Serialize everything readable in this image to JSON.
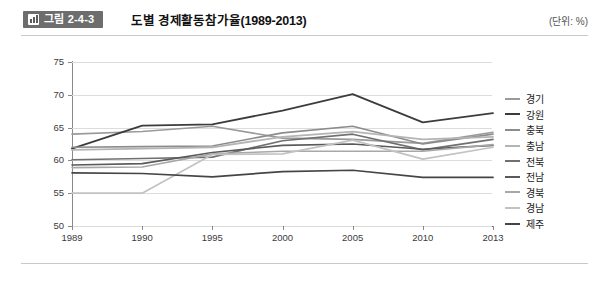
{
  "header": {
    "badge_label": "그림 2-4-3",
    "badge_icon": "bar-chart-icon",
    "title": "도별 경제활동참가율(1989-2013)",
    "unit_note": "(단위: %)",
    "badge_bg": "#6d6d6d"
  },
  "chart_data": {
    "type": "line",
    "title": "도별 경제활동참가율(1989-2013)",
    "xlabel": "",
    "ylabel": "",
    "unit": "%",
    "ylim": [
      50,
      75
    ],
    "yticks": [
      50,
      55,
      60,
      65,
      70,
      75
    ],
    "grid": true,
    "legend_position": "right",
    "categories": [
      "1989",
      "1990",
      "1995",
      "2000",
      "2005",
      "2010",
      "2013"
    ],
    "series": [
      {
        "name": "경기",
        "color": "#9a9a9a",
        "width": 1.6,
        "values": [
          64.0,
          64.4,
          65.2,
          63.4,
          63.2,
          62.6,
          64.3
        ]
      },
      {
        "name": "강원",
        "color": "#3c3c3c",
        "width": 1.8,
        "values": [
          61.8,
          65.3,
          65.5,
          67.6,
          70.1,
          65.8,
          67.2
        ]
      },
      {
        "name": "충북",
        "color": "#8c8c8c",
        "width": 1.6,
        "values": [
          62.0,
          62.1,
          62.2,
          64.2,
          65.2,
          62.5,
          64.0
        ]
      },
      {
        "name": "충남",
        "color": "#b4b4b4",
        "width": 1.8,
        "values": [
          61.6,
          61.8,
          62.0,
          63.6,
          64.4,
          63.2,
          63.6
        ]
      },
      {
        "name": "전북",
        "color": "#707070",
        "width": 1.6,
        "values": [
          60.1,
          60.3,
          60.5,
          63.0,
          64.0,
          61.6,
          63.2
        ]
      },
      {
        "name": "전남",
        "color": "#5a5a5a",
        "width": 1.7,
        "values": [
          59.3,
          59.5,
          61.2,
          62.3,
          62.5,
          61.7,
          62.3
        ]
      },
      {
        "name": "경북",
        "color": "#a8a8a8",
        "width": 1.6,
        "values": [
          58.9,
          59.0,
          61.0,
          61.4,
          61.4,
          61.4,
          62.4
        ]
      },
      {
        "name": "경남",
        "color": "#c2c2c2",
        "width": 1.7,
        "values": [
          55.0,
          55.0,
          60.9,
          61.0,
          63.1,
          60.2,
          62.0
        ]
      },
      {
        "name": "제주",
        "color": "#454545",
        "width": 1.7,
        "values": [
          58.1,
          58.0,
          57.5,
          58.3,
          58.5,
          57.4,
          57.4
        ]
      }
    ]
  }
}
